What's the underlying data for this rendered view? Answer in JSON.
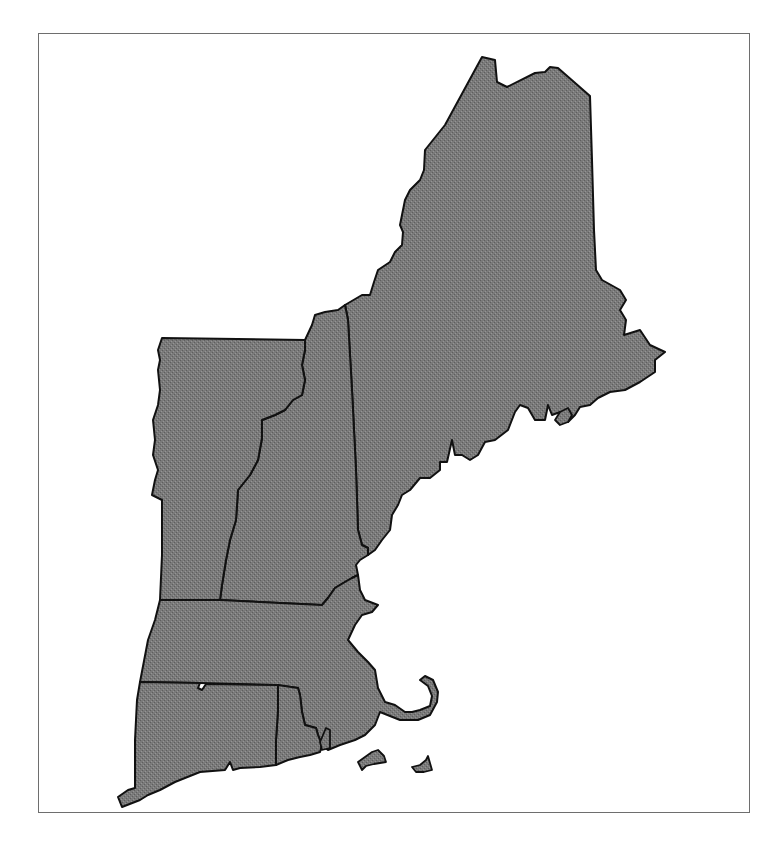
{
  "map": {
    "region": "New England",
    "fill_color": "#7a7a7a",
    "stroke_color": "#111111",
    "frame_color": "#6e6e6e",
    "background": "#ffffff",
    "states": [
      {
        "id": "ME",
        "name": "Maine"
      },
      {
        "id": "NH",
        "name": "New Hampshire"
      },
      {
        "id": "VT",
        "name": "Vermont"
      },
      {
        "id": "MA",
        "name": "Massachusetts"
      },
      {
        "id": "RI",
        "name": "Rhode Island"
      },
      {
        "id": "CT",
        "name": "Connecticut"
      }
    ],
    "islands": [
      "Martha's Vineyard",
      "Nantucket"
    ]
  }
}
